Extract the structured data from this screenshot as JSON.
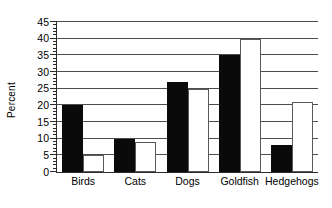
{
  "chart_data": {
    "type": "bar",
    "title": "",
    "xlabel": "",
    "ylabel": "Percent",
    "ylim": [
      0,
      45
    ],
    "ytick_step": 5,
    "yminor_step": 1,
    "grid": true,
    "legend": "none",
    "categories": [
      "Birds",
      "Cats",
      "Dogs",
      "Goldfish",
      "Hedgehogs"
    ],
    "ytick_labels": [
      "0",
      "5",
      "10",
      "15",
      "20",
      "25",
      "30",
      "35",
      "40",
      "45"
    ],
    "series": [
      {
        "name": "series-black",
        "color": "#0a0a0a",
        "values": [
          20,
          10,
          27,
          35,
          8
        ]
      },
      {
        "name": "series-white",
        "color": "#ffffff",
        "values": [
          5,
          9,
          25,
          40,
          21
        ]
      }
    ]
  }
}
